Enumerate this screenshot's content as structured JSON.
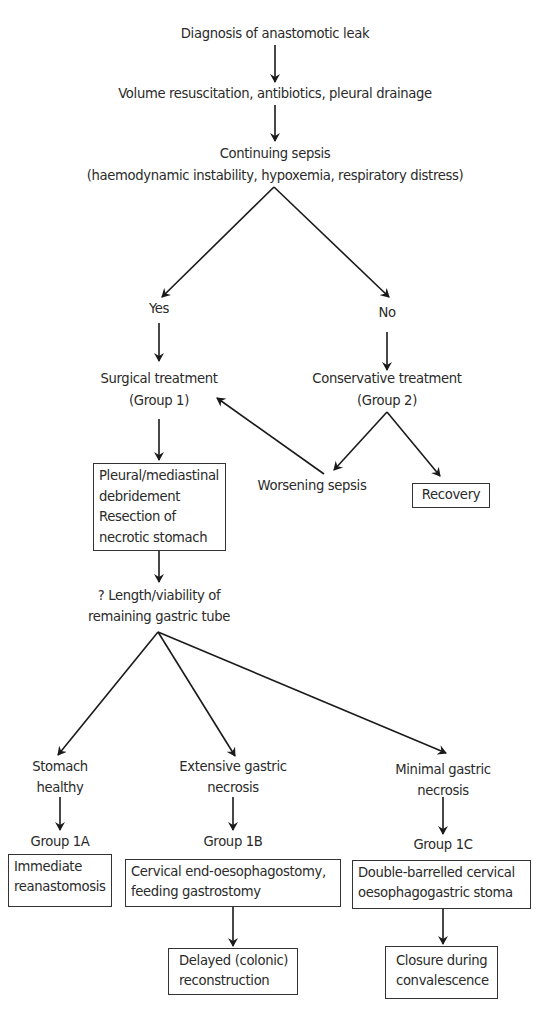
{
  "flowchart": {
    "diagnosis": "Diagnosis of anastomotic leak",
    "initial_treatment": "Volume resuscitation, antibiotics, pleural drainage",
    "continuing_sepsis": {
      "line1": "Continuing sepsis",
      "line2": "(haemodynamic instability, hypoxemia, respiratory distress)"
    },
    "yes_label": "Yes",
    "no_label": "No",
    "surgical": {
      "line1": "Surgical treatment",
      "line2": "(Group 1)"
    },
    "conservative": {
      "line1": "Conservative treatment",
      "line2": "(Group 2)"
    },
    "debridement_box": [
      "Pleural/mediastinal",
      "debridement",
      "Resection of",
      "necrotic stomach"
    ],
    "worsening_sepsis": "Worsening sepsis",
    "recovery_box": "Recovery",
    "gastric_tube": {
      "line1": "? Length/viability of",
      "line2": "remaining gastric tube"
    },
    "branches": [
      {
        "condition": [
          "Stomach",
          "healthy"
        ],
        "group": "Group 1A",
        "action": [
          "Immediate",
          "reanastomosis"
        ]
      },
      {
        "condition": [
          "Extensive gastric",
          "necrosis"
        ],
        "group": "Group 1B",
        "action": [
          "Cervical end-oesophagostomy,",
          "feeding gastrostomy"
        ],
        "followup": [
          "Delayed (colonic)",
          "reconstruction"
        ]
      },
      {
        "condition": [
          "Minimal gastric",
          "necrosis"
        ],
        "group": "Group 1C",
        "action": [
          "Double-barrelled cervical",
          "oesophagogastric stoma"
        ],
        "followup": [
          "Closure during",
          "convalescence"
        ]
      }
    ]
  }
}
